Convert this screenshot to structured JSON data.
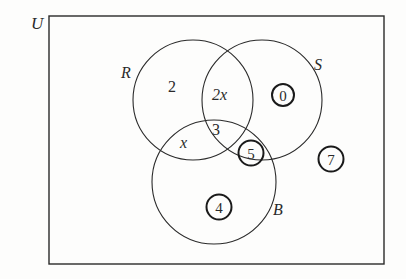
{
  "diagram": {
    "type": "venn",
    "universe_label": "U",
    "sets": [
      {
        "name": "R",
        "label": "R"
      },
      {
        "name": "S",
        "label": "S"
      },
      {
        "name": "B",
        "label": "B"
      }
    ],
    "region_values": {
      "R_only": "2",
      "R_and_S_only": "2x",
      "R_and_S_and_B": "3",
      "R_and_B_only": "x"
    },
    "circled_numbers": {
      "in_S_only": "0",
      "in_S_and_B_only": "5",
      "in_B_only": "4",
      "outside_all": "7"
    },
    "colors": {
      "line": "#2a2a2a",
      "background": "#fdfdfc"
    }
  }
}
